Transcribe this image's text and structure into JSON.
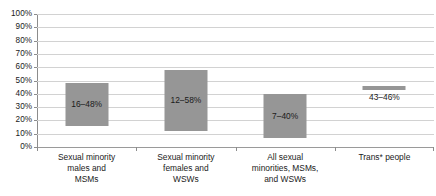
{
  "chart_data": {
    "type": "bar",
    "title": "",
    "subtitle": "",
    "xlabel": "",
    "ylabel": "",
    "ylim": [
      0,
      100
    ],
    "grid": true,
    "legend": "none",
    "bar_style": "range-bar",
    "y_ticks": [
      "0%",
      "10%",
      "20%",
      "30%",
      "40%",
      "50%",
      "60%",
      "70%",
      "80%",
      "90%",
      "100%"
    ],
    "y_tick_values": [
      0,
      10,
      20,
      30,
      40,
      50,
      60,
      70,
      80,
      90,
      100
    ],
    "categories": [
      "Sexual minority males and MSMs",
      "Sexual minority females and WSWs",
      "All sexual minorities, MSMs, and WSWs",
      "Trans* people"
    ],
    "category_label_lines": [
      [
        "Sexual minority",
        "males and",
        "MSMs"
      ],
      [
        "Sexual minority",
        "females and",
        "WSWs"
      ],
      [
        "All sexual",
        "minorities, MSMs,",
        "and WSWs"
      ],
      [
        "Trans* people"
      ]
    ],
    "series": [
      {
        "name": "Prevalence range",
        "low": [
          16,
          12,
          7,
          43
        ],
        "high": [
          48,
          58,
          40,
          46
        ],
        "labels": [
          "16–48%",
          "12–58%",
          "7–40%",
          "43–46%"
        ],
        "label_position": [
          "inside",
          "inside",
          "inside",
          "below"
        ]
      }
    ],
    "colors": {
      "bar_fill": "#969696",
      "gridline": "#d2d2d2",
      "axis_line": "#8c8c8c",
      "text": "#1a1a1a",
      "background": "#ffffff"
    }
  }
}
